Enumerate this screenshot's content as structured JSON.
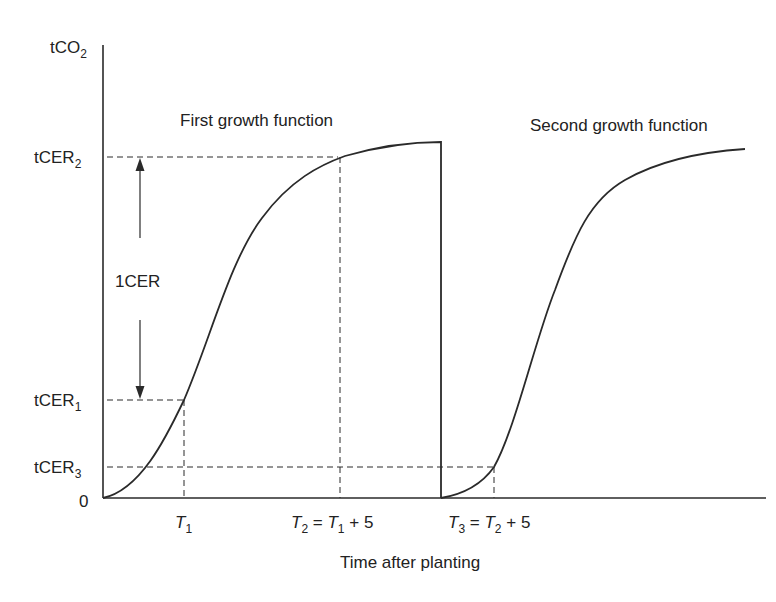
{
  "diagram": {
    "type": "growth-function-diagram",
    "y_axis": {
      "label_main": "tCO",
      "label_sub": "2"
    },
    "x_axis": {
      "title": "Time after planting",
      "origin_label": "0"
    },
    "y_levels": [
      {
        "main": "tCER",
        "sub": "2"
      },
      {
        "main": "tCER",
        "sub": "1"
      },
      {
        "main": "tCER",
        "sub": "3"
      }
    ],
    "x_ticks": [
      {
        "main": "T",
        "sub": "1",
        "rest": ""
      },
      {
        "main": "T",
        "sub": "2",
        "eq": " = ",
        "main2": "T",
        "sub2": "1",
        "rest": " + 5"
      },
      {
        "main": "T",
        "sub": "3",
        "eq": " = ",
        "main2": "T",
        "sub2": "2",
        "rest": " + 5"
      }
    ],
    "annotations": {
      "first_curve": "First growth function",
      "second_curve": "Second growth function",
      "span_label": "1CER"
    },
    "colors": {
      "line": "#2a2a2a",
      "text": "#222222",
      "background": "#ffffff"
    }
  }
}
